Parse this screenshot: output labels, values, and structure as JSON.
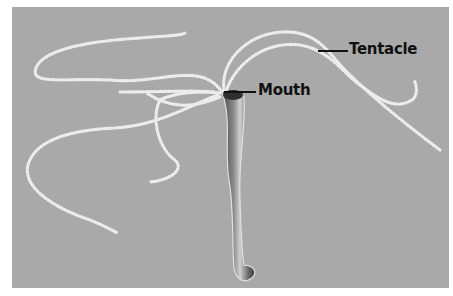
{
  "figure": {
    "background_color": "#a9a9a9",
    "body_color": "#6e6e6e",
    "tentacle_color": "#e6e6e6",
    "label_color": "#111111"
  },
  "labels": [
    {
      "id": "tentacle",
      "text": "Tentacle"
    },
    {
      "id": "mouth",
      "text": "Mouth"
    }
  ]
}
